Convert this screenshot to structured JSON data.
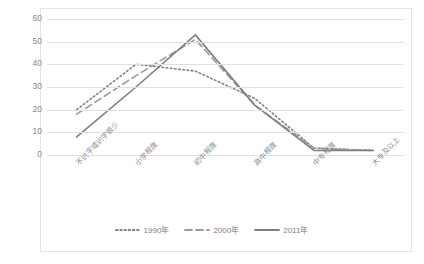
{
  "chart_data": {
    "type": "line",
    "title": "",
    "xlabel": "",
    "ylabel": "",
    "ylim": [
      0,
      60
    ],
    "yticks": [
      60,
      50,
      40,
      30,
      20,
      10,
      0
    ],
    "grid": true,
    "legend_position": "bottom",
    "categories": [
      "不识字或识字很少",
      "小学程度",
      "初中程度",
      "高中程度",
      "中专程度",
      "大专及以上"
    ],
    "series": [
      {
        "name": "1990年",
        "style": "dotted",
        "color": "#808080",
        "values": [
          20,
          40,
          37,
          25,
          3,
          2
        ]
      },
      {
        "name": "2000年",
        "style": "dashed",
        "color": "#9b9b9b",
        "values": [
          18,
          35,
          51,
          22,
          3,
          2
        ]
      },
      {
        "name": "2011年",
        "style": "solid",
        "color": "#7f7f7f",
        "values": [
          8,
          30,
          53,
          22,
          2,
          2
        ]
      }
    ]
  },
  "legend": {
    "items": [
      {
        "label": "1990年"
      },
      {
        "label": "2000年"
      },
      {
        "label": "2011年"
      }
    ]
  },
  "colors": {
    "grid": "#e0e0e0",
    "border": "#e3e3e3",
    "tick_text": "#8a8a8a",
    "background": "#ffffff"
  }
}
